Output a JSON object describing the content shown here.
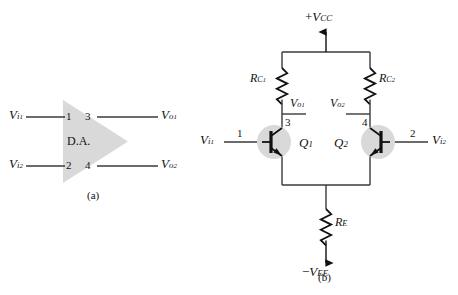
{
  "figure": {
    "captions": {
      "a": "(a)",
      "b": "(b)"
    }
  },
  "block_diagram": {
    "block_label": "D.A.",
    "inputs": [
      {
        "signal_base": "V",
        "signal_sub": "i",
        "signal_sub2": "1",
        "pin": "1"
      },
      {
        "signal_base": "V",
        "signal_sub": "i",
        "signal_sub2": "2",
        "pin": "2"
      }
    ],
    "outputs": [
      {
        "signal_base": "V",
        "signal_sub": "o",
        "signal_sub2": "1",
        "pin": "3"
      },
      {
        "signal_base": "V",
        "signal_sub": "o",
        "signal_sub2": "2",
        "pin": "4"
      }
    ]
  },
  "circuit": {
    "supply_positive": {
      "sign": "+",
      "base": "V",
      "sub": "CC"
    },
    "supply_negative": {
      "sign": "−",
      "base": "V",
      "sub": "EE"
    },
    "resistors": [
      {
        "base": "R",
        "sub": "C",
        "sub2": "1"
      },
      {
        "base": "R",
        "sub": "C",
        "sub2": "2"
      },
      {
        "base": "R",
        "sub": "E",
        "sub2": ""
      }
    ],
    "transistors": [
      {
        "base": "Q",
        "sub": "1"
      },
      {
        "base": "Q",
        "sub": "2"
      }
    ],
    "outputs": [
      {
        "base": "V",
        "sub": "o",
        "sub2": "1"
      },
      {
        "base": "V",
        "sub": "o",
        "sub2": "2"
      }
    ],
    "inputs": [
      {
        "base": "V",
        "sub": "i",
        "sub2": "1"
      },
      {
        "base": "V",
        "sub": "i",
        "sub2": "2"
      }
    ],
    "pins": {
      "base1": "1",
      "base2": "2",
      "collector1": "3",
      "collector2": "4"
    }
  },
  "colors": {
    "wire": "#3a3a3a",
    "shade": "#d9d9d9",
    "device": "#111111",
    "background": "#ffffff"
  }
}
